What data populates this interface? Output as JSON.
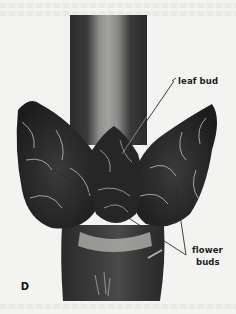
{
  "figure": {
    "plate_letter": "D",
    "labels": {
      "leaf_bud": "leaf bud",
      "flower_buds_line1": "flower",
      "flower_buds_line2": "buds"
    }
  },
  "colors": {
    "paper": "#f3f3f1",
    "stem_dark": "#2a2a2a",
    "stem_light": "#9a9a98",
    "bud_dark": "#1e1e1e",
    "leader_line": "#2a2a2a"
  }
}
